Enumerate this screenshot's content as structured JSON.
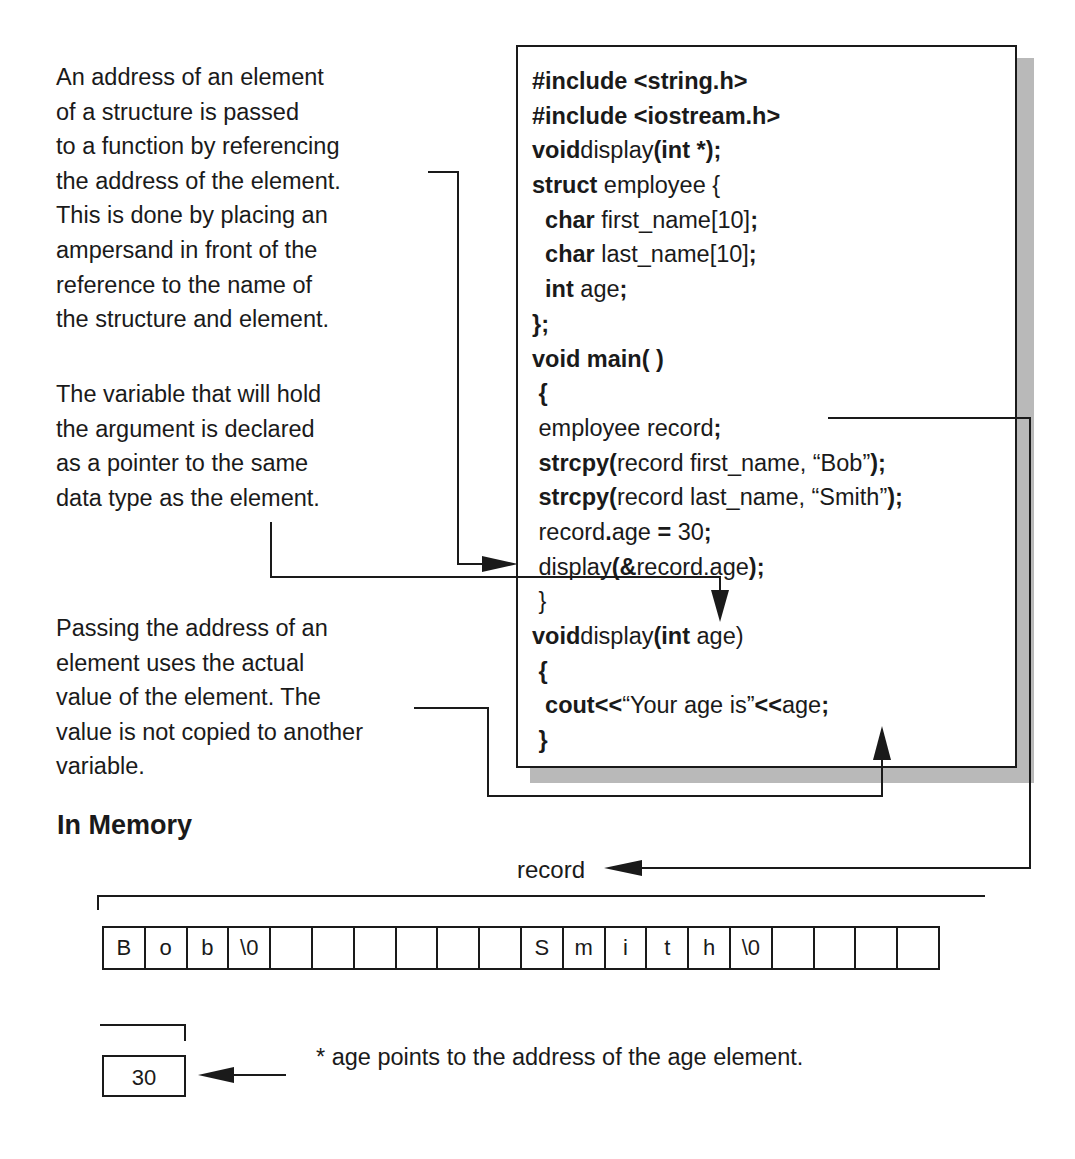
{
  "notes": {
    "address_passing": [
      "An address of an element",
      "of a structure is passed",
      "to a function by referencing",
      "the address of the element.",
      "This is done by placing an",
      "ampersand in front of the",
      "reference to the name of",
      "the structure and element."
    ],
    "pointer_variable": [
      "The variable that will hold",
      "the argument is declared",
      "as a pointer to the same",
      "data type as the element."
    ],
    "actual_value": [
      "Passing the address of an",
      "element uses the actual",
      "value of the element. The",
      "value is not copied to another",
      "variable."
    ]
  },
  "code": {
    "lines": [
      [
        {
          "t": "#include <string.h>",
          "b": true
        }
      ],
      [
        {
          "t": "#include <iostream.h>",
          "b": true
        }
      ],
      [
        {
          "t": "void",
          "b": true
        },
        {
          "t": "display",
          "b": false
        },
        {
          "t": "(int *);",
          "b": true
        }
      ],
      [
        {
          "t": "struct",
          "b": true
        },
        {
          "t": " employee {",
          "b": false
        }
      ],
      [
        {
          "t": "  char",
          "b": true
        },
        {
          "t": " first_name[10]",
          "b": false
        },
        {
          "t": ";",
          "b": true
        }
      ],
      [
        {
          "t": "  char",
          "b": true
        },
        {
          "t": " last_name[10]",
          "b": false
        },
        {
          "t": ";",
          "b": true
        }
      ],
      [
        {
          "t": "  int",
          "b": true
        },
        {
          "t": " age",
          "b": false
        },
        {
          "t": ";",
          "b": true
        }
      ],
      [
        {
          "t": "};",
          "b": true
        }
      ],
      [
        {
          "t": "void main( )",
          "b": true
        }
      ],
      [
        {
          "t": " {",
          "b": true
        }
      ],
      [
        {
          "t": " employee record",
          "b": false
        },
        {
          "t": ";",
          "b": true
        }
      ],
      [
        {
          "t": " strcpy(",
          "b": true
        },
        {
          "t": "record first_name, “Bob”",
          "b": false
        },
        {
          "t": ");",
          "b": true
        }
      ],
      [
        {
          "t": " strcpy(",
          "b": true
        },
        {
          "t": "record last_name, “Smith”",
          "b": false
        },
        {
          "t": ");",
          "b": true
        }
      ],
      [
        {
          "t": " record",
          "b": false
        },
        {
          "t": ".",
          "b": true
        },
        {
          "t": "age ",
          "b": false
        },
        {
          "t": "=",
          "b": true
        },
        {
          "t": " 30",
          "b": false
        },
        {
          "t": ";",
          "b": true
        }
      ],
      [
        {
          "t": " display",
          "b": false
        },
        {
          "t": "(&",
          "b": true
        },
        {
          "t": "record.age",
          "b": false
        },
        {
          "t": ");",
          "b": true
        }
      ],
      [
        {
          "t": " }",
          "b": false
        }
      ],
      [
        {
          "t": "void",
          "b": true
        },
        {
          "t": "display",
          "b": false
        },
        {
          "t": "(int",
          "b": true
        },
        {
          "t": " age)",
          "b": false
        }
      ],
      [
        {
          "t": " {",
          "b": true
        }
      ],
      [
        {
          "t": "  cout<<",
          "b": true
        },
        {
          "t": "“Your age is”",
          "b": false
        },
        {
          "t": "<<",
          "b": true
        },
        {
          "t": "age",
          "b": false
        },
        {
          "t": ";",
          "b": true
        }
      ],
      [
        {
          "t": " }",
          "b": true
        }
      ]
    ]
  },
  "memory": {
    "title": "In Memory",
    "record_label": "record",
    "cells": [
      "B",
      "o",
      "b",
      "\\0",
      "",
      "",
      "",
      "",
      "",
      "",
      "S",
      "m",
      "i",
      "t",
      "h",
      "\\0",
      "",
      "",
      "",
      ""
    ],
    "age_value": "30",
    "age_note": "* age points to the address of the age element."
  }
}
